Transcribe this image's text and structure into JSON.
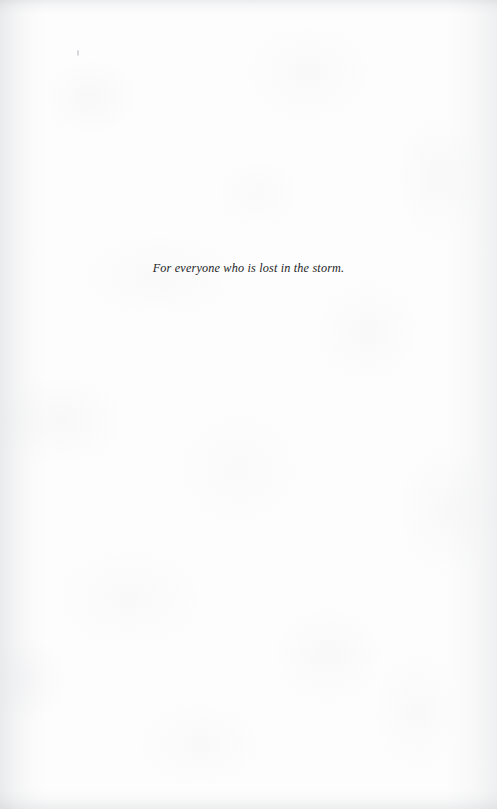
{
  "page": {
    "kind": "book-dedication-page",
    "width": 497,
    "height": 809,
    "background_color": "#fdfdfd",
    "ink_color": "#1d1d1f"
  },
  "dedication": {
    "text": "For everyone who is lost in the storm."
  },
  "marks": {
    "speck_label": ""
  }
}
